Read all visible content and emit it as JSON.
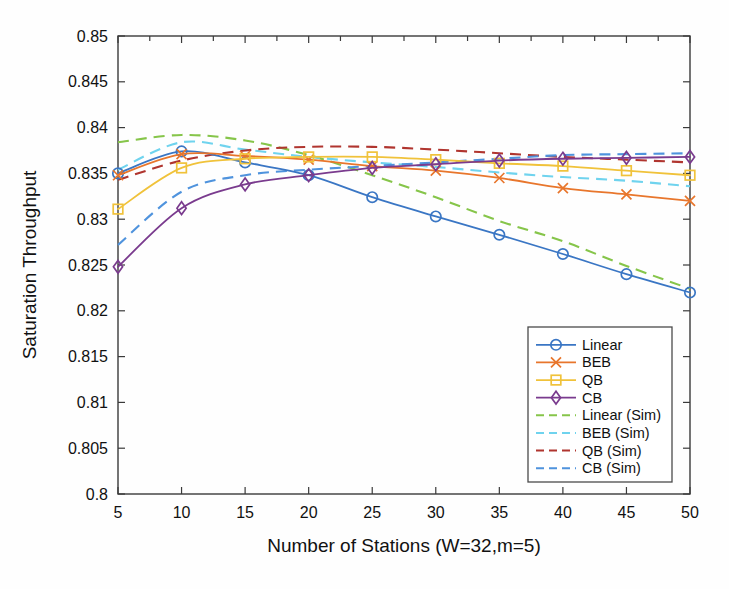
{
  "chart_data": {
    "type": "line",
    "title": "",
    "xlabel": "Number of Stations (W=32,m=5)",
    "ylabel": "Saturation Throughput",
    "x": [
      5,
      10,
      15,
      20,
      25,
      30,
      35,
      40,
      45,
      50
    ],
    "xlim": [
      5,
      50
    ],
    "ylim": [
      0.8,
      0.85
    ],
    "xticks": [
      "5",
      "10",
      "15",
      "20",
      "25",
      "30",
      "35",
      "40",
      "45",
      "50"
    ],
    "yticks": [
      "0.8",
      "0.805",
      "0.81",
      "0.815",
      "0.82",
      "0.825",
      "0.83",
      "0.835",
      "0.84",
      "0.845",
      "0.85"
    ],
    "grid": false,
    "legend_position": "lower right",
    "series": [
      {
        "name": "Linear",
        "color": "#3a76c4",
        "style": "solid",
        "marker": "circle",
        "values": [
          0.835,
          0.8374,
          0.8362,
          0.8348,
          0.8324,
          0.8303,
          0.8283,
          0.8262,
          0.824,
          0.822
        ]
      },
      {
        "name": "BEB",
        "color": "#e8762c",
        "style": "solid",
        "marker": "x",
        "values": [
          0.8348,
          0.8371,
          0.8369,
          0.8365,
          0.8358,
          0.8353,
          0.8345,
          0.8334,
          0.8327,
          0.832
        ]
      },
      {
        "name": "QB",
        "color": "#f0c23a",
        "style": "solid",
        "marker": "square",
        "values": [
          0.8311,
          0.8356,
          0.8366,
          0.8368,
          0.8368,
          0.8365,
          0.8361,
          0.8358,
          0.8353,
          0.8348
        ]
      },
      {
        "name": "CB",
        "color": "#7a3b8e",
        "style": "solid",
        "marker": "diamond",
        "values": [
          0.8248,
          0.8312,
          0.8338,
          0.8348,
          0.8356,
          0.836,
          0.8364,
          0.8366,
          0.8367,
          0.8368
        ]
      },
      {
        "name": "Linear (Sim)",
        "color": "#86c54a",
        "style": "dashed",
        "marker": "none",
        "values": [
          0.8384,
          0.8392,
          0.8386,
          0.837,
          0.8348,
          0.8324,
          0.8298,
          0.8276,
          0.8249,
          0.8224
        ]
      },
      {
        "name": "BEB (Sim)",
        "color": "#6fd3ee",
        "style": "dashed",
        "marker": "none",
        "values": [
          0.8354,
          0.8384,
          0.8376,
          0.8368,
          0.8362,
          0.8357,
          0.8351,
          0.8346,
          0.8342,
          0.8336
        ]
      },
      {
        "name": "QB (Sim)",
        "color": "#b0352f",
        "style": "dashed",
        "marker": "none",
        "values": [
          0.8343,
          0.8364,
          0.8375,
          0.8379,
          0.8379,
          0.8376,
          0.8372,
          0.8368,
          0.8365,
          0.8362
        ]
      },
      {
        "name": "CB (Sim)",
        "color": "#4f93dd",
        "style": "dashed",
        "marker": "none",
        "values": [
          0.8272,
          0.833,
          0.8348,
          0.8354,
          0.8358,
          0.8362,
          0.8366,
          0.837,
          0.8371,
          0.8372
        ]
      }
    ]
  }
}
